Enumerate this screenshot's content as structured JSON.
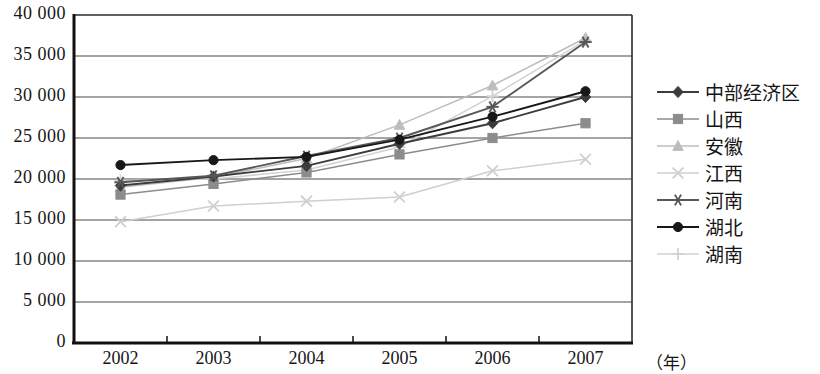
{
  "chart_data": {
    "type": "line",
    "title": "",
    "xlabel": "（年）",
    "ylabel": "",
    "categories": [
      "2002",
      "2003",
      "2004",
      "2005",
      "2006",
      "2007"
    ],
    "ylim": [
      0,
      40000
    ],
    "ytick_step": 5000,
    "yticks": [
      "0",
      "5 000",
      "10 000",
      "15 000",
      "20 000",
      "25 000",
      "30 000",
      "35 000",
      "40 000"
    ],
    "ytick_values": [
      0,
      5000,
      10000,
      15000,
      20000,
      25000,
      30000,
      35000,
      40000
    ],
    "grid": true,
    "legend_position": "right",
    "series": [
      {
        "name": "中部经济区",
        "marker": "diamond",
        "color": "#3c3c3c",
        "values": [
          19200,
          20300,
          21600,
          24300,
          26800,
          30000
        ]
      },
      {
        "name": "山西",
        "marker": "square",
        "color": "#8c8c8c",
        "values": [
          18100,
          19400,
          20800,
          23000,
          25000,
          26800
        ]
      },
      {
        "name": "安徽",
        "marker": "triangle",
        "color": "#bdbdbd",
        "values": [
          19000,
          20200,
          22500,
          26600,
          31400,
          37200
        ]
      },
      {
        "name": "江西",
        "marker": "x",
        "color": "#cfcfcf",
        "values": [
          14800,
          16700,
          17300,
          17800,
          21000,
          22400
        ]
      },
      {
        "name": "河南",
        "marker": "asterisk",
        "color": "#575757",
        "values": [
          19600,
          20400,
          22800,
          25000,
          28800,
          36700
        ]
      },
      {
        "name": "湖北",
        "marker": "circle",
        "color": "#181818",
        "values": [
          21700,
          22300,
          22700,
          24800,
          27600,
          30700
        ]
      },
      {
        "name": "湖南",
        "marker": "plus",
        "color": "#d2d2d2",
        "values": [
          19800,
          20000,
          21100,
          23900,
          30100,
          36900
        ]
      }
    ]
  }
}
